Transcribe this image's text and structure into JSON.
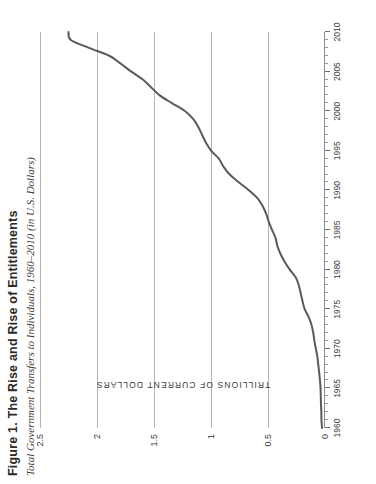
{
  "figure": {
    "label": "Figure 1.",
    "title_main": "The Rise and Rise of Entitlements",
    "title_full": "Figure 1. The Rise and Rise of Entitlements",
    "subtitle": "Total Government Transfers to Individuals, 1960–2010 (in U.S. Dollars)"
  },
  "chart_data": {
    "type": "line",
    "title": "Figure 1. The Rise and Rise of Entitlements",
    "subtitle": "Total Government Transfers to Individuals, 1960–2010 (in U.S. Dollars)",
    "xlabel": "",
    "ylabel": "TRILLIONS OF CURRENT DOLLARS",
    "xlim": [
      1960,
      2010
    ],
    "ylim": [
      0,
      2.5
    ],
    "xticks": [
      1960,
      1965,
      1970,
      1975,
      1980,
      1985,
      1990,
      1995,
      2000,
      2005,
      2010
    ],
    "xtick_labels": [
      "1960",
      "1965",
      "1970",
      "1975",
      "1980",
      "1985",
      "1990",
      "1995",
      "2000",
      "2005",
      "2010"
    ],
    "x_minor_tick_step": 1,
    "yticks": [
      0,
      0.5,
      1,
      1.5,
      2,
      2.5
    ],
    "ytick_labels": [
      "0",
      "0.5",
      "1",
      "1.5",
      "2",
      "2.5"
    ],
    "grid": "y-gridlines-only",
    "legend": "none",
    "line_color": "#5a5a5a",
    "gridline_color": "#b4b4b4",
    "series": [
      {
        "name": "Total Government Transfers to Individuals",
        "units": "trillions of current U.S. dollars",
        "x": [
          1960,
          1961,
          1962,
          1963,
          1964,
          1965,
          1966,
          1967,
          1968,
          1969,
          1970,
          1971,
          1972,
          1973,
          1974,
          1975,
          1976,
          1977,
          1978,
          1979,
          1980,
          1981,
          1982,
          1983,
          1984,
          1985,
          1986,
          1987,
          1988,
          1989,
          1990,
          1991,
          1992,
          1993,
          1994,
          1995,
          1996,
          1997,
          1998,
          1999,
          2000,
          2001,
          2002,
          2003,
          2004,
          2005,
          2006,
          2007,
          2008,
          2009,
          2010
        ],
        "values": [
          0.026,
          0.031,
          0.032,
          0.035,
          0.037,
          0.039,
          0.044,
          0.051,
          0.059,
          0.067,
          0.08,
          0.093,
          0.103,
          0.118,
          0.143,
          0.178,
          0.197,
          0.213,
          0.23,
          0.256,
          0.309,
          0.354,
          0.391,
          0.418,
          0.434,
          0.464,
          0.492,
          0.515,
          0.546,
          0.591,
          0.665,
          0.754,
          0.836,
          0.89,
          0.931,
          0.997,
          1.043,
          1.078,
          1.111,
          1.155,
          1.226,
          1.34,
          1.45,
          1.524,
          1.598,
          1.699,
          1.792,
          1.892,
          2.07,
          2.23,
          2.25
        ]
      }
    ],
    "annotations": []
  },
  "y_axis": {
    "title": "TRILLIONS OF CURRENT DOLLARS",
    "ticks": [
      {
        "value": 0,
        "label": "0"
      },
      {
        "value": 0.5,
        "label": "0.5"
      },
      {
        "value": 1,
        "label": "1"
      },
      {
        "value": 1.5,
        "label": "1.5"
      },
      {
        "value": 2,
        "label": "2"
      },
      {
        "value": 2.5,
        "label": "2.5"
      }
    ]
  },
  "x_axis": {
    "ticks": [
      {
        "value": 1960,
        "label": "1960"
      },
      {
        "value": 1965,
        "label": "1965"
      },
      {
        "value": 1970,
        "label": "1970"
      },
      {
        "value": 1975,
        "label": "1975"
      },
      {
        "value": 1980,
        "label": "1980"
      },
      {
        "value": 1985,
        "label": "1985"
      },
      {
        "value": 1990,
        "label": "1990"
      },
      {
        "value": 1995,
        "label": "1995"
      },
      {
        "value": 2000,
        "label": "2000"
      },
      {
        "value": 2005,
        "label": "2005"
      },
      {
        "value": 2010,
        "label": "2010"
      }
    ]
  }
}
